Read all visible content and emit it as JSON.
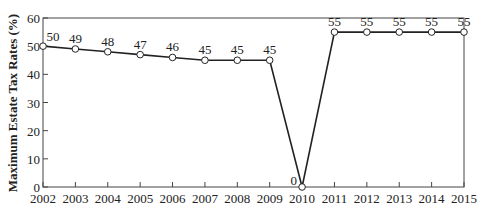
{
  "chart_data": {
    "type": "line",
    "title": "",
    "xlabel": "",
    "ylabel": "Maximum Estate Tax Rates (%)",
    "categories": [
      "2002",
      "2003",
      "2004",
      "2005",
      "2006",
      "2007",
      "2008",
      "2009",
      "2010",
      "2011",
      "2012",
      "2013",
      "2014",
      "2015"
    ],
    "series": [
      {
        "name": "Maximum Estate Tax Rate",
        "values": [
          50,
          49,
          48,
          47,
          46,
          45,
          45,
          45,
          0,
          55,
          55,
          55,
          55,
          55
        ]
      }
    ],
    "data_labels": [
      "50",
      "49",
      "48",
      "47",
      "46",
      "45",
      "45",
      "45",
      "0",
      "55",
      "55",
      "55",
      "55",
      "55"
    ],
    "yticks": [
      "0",
      "10",
      "20",
      "30",
      "40",
      "50",
      "60"
    ],
    "ylim": [
      0,
      60
    ],
    "grid": false,
    "legend": "none",
    "colors": {
      "line": "#222222",
      "marker_fill": "#ffffff",
      "axis": "#444444"
    }
  }
}
